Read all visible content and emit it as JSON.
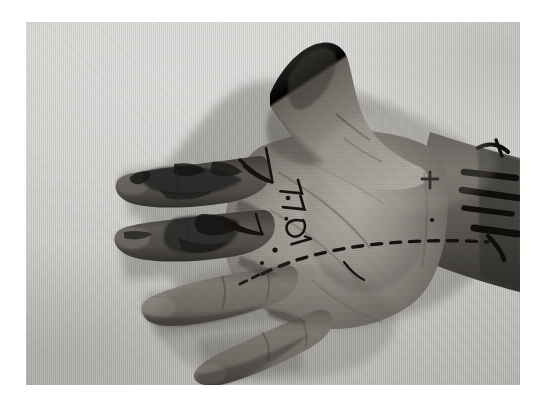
{
  "page": {
    "background_color": "#ffffff",
    "plate_background_color": "#d6d5d0"
  },
  "figure": {
    "caption": "",
    "modality": "clinical photograph",
    "color_mode": "grayscale",
    "backdrop": "light gray woven cloth drape",
    "plate": {
      "x": 26,
      "y": 22,
      "width": 494,
      "height": 363
    }
  },
  "anatomy": {
    "regions": [
      {
        "name": "thumb",
        "label": "thumb-abducted-superiorly"
      },
      {
        "name": "index-finger",
        "label": "index-finger-extended"
      },
      {
        "name": "middle-finger",
        "label": "middle-finger-extended"
      },
      {
        "name": "ring-finger",
        "label": "ring-finger-flexed"
      },
      {
        "name": "little-finger",
        "label": "little-finger-flexed"
      },
      {
        "name": "thenar-eminence",
        "label": "thenar-eminence"
      },
      {
        "name": "hypothenar-eminence",
        "label": "hypothenar-eminence"
      },
      {
        "name": "wrist",
        "label": "wrist-crease"
      },
      {
        "name": "forearm",
        "label": "distal-forearm"
      }
    ]
  },
  "markings": {
    "ink_color": "#15120f",
    "items": [
      {
        "name": "dashed-incision-line",
        "type": "dashed-line",
        "location": "distal palm, transverse, extending to ulnar wrist"
      },
      {
        "name": "handwritten-annotation",
        "type": "text",
        "text": "77.01",
        "orientation": "rotated",
        "location": "central palm"
      },
      {
        "name": "chevron-mark-proximal",
        "type": "chevron",
        "location": "second web space"
      },
      {
        "name": "chevron-mark-distal",
        "type": "chevron",
        "location": "third web space"
      },
      {
        "name": "ink-dot-upper",
        "type": "dot",
        "location": "central palm"
      },
      {
        "name": "ink-dot-lower",
        "type": "dot",
        "location": "mid palm"
      },
      {
        "name": "cross-mark-wrist",
        "type": "cross",
        "location": "ulnar wrist"
      },
      {
        "name": "forearm-bar-marks",
        "type": "bars",
        "location": "distal forearm, ulnar border"
      }
    ]
  },
  "lesions": {
    "items": [
      {
        "name": "index-finger-lesion",
        "location": "index finger, volar pulp and middle phalanx",
        "appearance": "dark hyperpigmented irregular plaque"
      },
      {
        "name": "middle-finger-lesion",
        "location": "middle finger, volar proximal and middle phalanx",
        "appearance": "dark hyperpigmented irregular plaque"
      }
    ]
  },
  "tones": {
    "skin_light": "#b2aea7",
    "skin_mid": "#8d8880",
    "skin_dark": "#63605a",
    "skin_deep": "#3c3a36",
    "lesion": "#2a2825",
    "backdrop_light": "#e4e3df",
    "backdrop_dark": "#b9b8b2"
  }
}
